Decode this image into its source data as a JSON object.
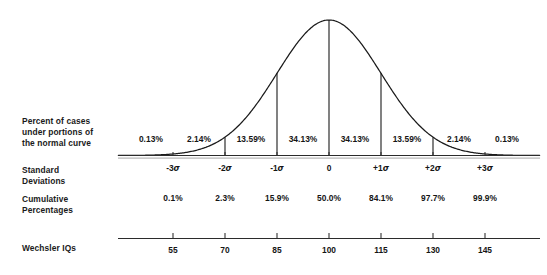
{
  "row_labels": {
    "percent_cases": "Percent of cases\nunder portions of\nthe normal curve",
    "standard_deviations": "Standard\nDeviations",
    "cumulative_percentages": "Cumulative\nPercentages",
    "wechsler_iqs": "Wechsler IQs"
  },
  "chart_data": {
    "type": "area",
    "xlabel": "Standard Deviations",
    "ylabel": "",
    "grid": false,
    "legend": "none",
    "curve": "standard normal (gaussian) density",
    "xlim": [
      -3.9,
      3.9
    ],
    "sigma_ticks": [
      -3,
      -2,
      -1,
      0,
      1,
      2,
      3
    ],
    "sigma_labels": [
      "-3σ",
      "-2σ",
      "-1σ",
      "0",
      "+1σ",
      "+2σ",
      "+3σ"
    ],
    "band_edges": [
      -4,
      -3,
      -2,
      -1,
      0,
      1,
      2,
      3,
      4
    ],
    "band_percent_labels": [
      "0.13%",
      "2.14%",
      "13.59%",
      "34.13%",
      "34.13%",
      "13.59%",
      "2.14%",
      "0.13%"
    ],
    "band_percent_values": [
      0.13,
      2.14,
      13.59,
      34.13,
      34.13,
      13.59,
      2.14,
      0.13
    ],
    "cumulative_labels": [
      "0.1%",
      "2.3%",
      "15.9%",
      "50.0%",
      "84.1%",
      "97.7%",
      "99.9%"
    ],
    "cumulative_values": [
      0.1,
      2.3,
      15.9,
      50.0,
      84.1,
      97.7,
      99.9
    ],
    "wechsler_iq_labels": [
      "55",
      "70",
      "85",
      "100",
      "115",
      "130",
      "145"
    ],
    "wechsler_iq_values": [
      55,
      70,
      85,
      100,
      115,
      130,
      145
    ],
    "drop_lines_at_sigma": [
      -2,
      -1,
      0,
      1,
      2
    ],
    "colors": {
      "curve": "#1a1a1a",
      "axis": "#2b2b2b",
      "text": "#151515",
      "background": "#ffffff"
    }
  }
}
